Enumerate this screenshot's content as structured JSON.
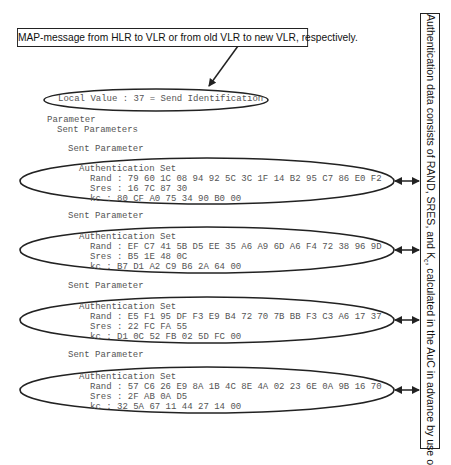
{
  "callouts": {
    "top": "MAP-message from HLR to VLR or from old VLR to new VLR, respectively.",
    "side_prefix": "Authentication data consists of RAND, SRES, and K",
    "side_sub1": "c",
    "side_mid": ", calculated in the AuC in advance by use of K",
    "side_sub2": "i",
    "side_suffix": "."
  },
  "message": {
    "local_value": "Local Value : 37 = Send Identification",
    "parameter": "Parameter",
    "sent_parameters": "Sent Parameters",
    "sets": [
      {
        "header": "Sent Parameter",
        "title": "Authentication Set",
        "rand": "Rand : 79 60 1C 08 94 92 5C 3C 1F 14 B2 95 C7 86 E0 F2",
        "sres": "Sres : 16 7C 87 30",
        "kc": "kc : 80 CF A0 75 34 90 B0 00"
      },
      {
        "header": "Sent Parameter",
        "title": "Authentication Set",
        "rand": "Rand : EF C7 41 5B D5 EE 35 A6 A9 6D A6 F4 72 38 96 9D",
        "sres": "Sres : B5 1E 48 0C",
        "kc": "kc : B7 D1 A2 C9 B6 2A 64 00"
      },
      {
        "header": "Sent Parameter",
        "title": "Authentication Set",
        "rand": "Rand : E5 F1 95 DF F3 E9 B4 72 70 7B BB F3 C3 A6 17 37",
        "sres": "Sres : 22 FC FA 55",
        "kc": "kc : D1 0C 52 FB 02 5D FC 00"
      },
      {
        "header": "Sent Parameter",
        "title": "Authentication Set",
        "rand": "Rand : 57 C6 26 E9 8A 1B 4C 8E 4A 02 23 6E 0A 9B 16 70",
        "sres": "Sres : 2F AB 0A D5",
        "kc": "kc : 32 5A 67 11 44 27 14 00"
      }
    ]
  }
}
